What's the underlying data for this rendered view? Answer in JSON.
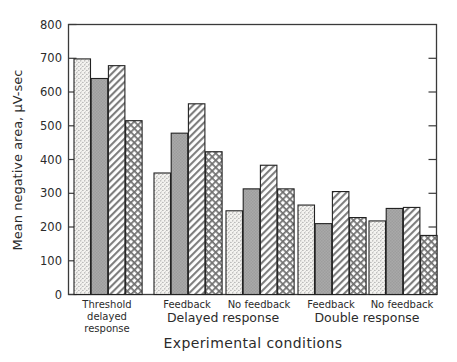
{
  "chart_data": {
    "type": "bar",
    "title": "",
    "subtitle": "",
    "xlabel": "Experimental conditions",
    "ylabel": "Mean negative area,  μV-sec",
    "ylim": [
      0,
      800
    ],
    "ytick_step": 100,
    "yticks": [
      "0",
      "100",
      "200",
      "300",
      "400",
      "500",
      "600",
      "700",
      "800"
    ],
    "grid": false,
    "legend": "none",
    "categories": [
      "Threshold delayed response",
      "Delayed response – Feedback",
      "Delayed response – No feedback",
      "Double response – Feedback",
      "Double response – No feedback"
    ],
    "series": [
      {
        "name": "Series 1",
        "pattern": "stipple",
        "values": [
          698,
          360,
          248,
          265,
          218
        ]
      },
      {
        "name": "Series 2",
        "pattern": "solid-gray",
        "values": [
          640,
          478,
          313,
          210,
          255
        ]
      },
      {
        "name": "Series 3",
        "pattern": "diagonal",
        "values": [
          678,
          565,
          383,
          305,
          258
        ]
      },
      {
        "name": "Series 4",
        "pattern": "crosshatch",
        "values": [
          515,
          423,
          313,
          228,
          175
        ]
      }
    ],
    "group_labels": [
      {
        "sub": "Threshold",
        "sub2": "delayed",
        "sub3": "response",
        "main": ""
      },
      {
        "sub": "Feedback",
        "sub2": "",
        "sub3": "",
        "main": "Delayed response"
      },
      {
        "sub": "No feedback",
        "sub2": "",
        "sub3": "",
        "main": ""
      },
      {
        "sub": "Feedback",
        "sub2": "",
        "sub3": "",
        "main": "Double response"
      },
      {
        "sub": "No feedback",
        "sub2": "",
        "sub3": "",
        "main": ""
      }
    ],
    "group_major_labels": [
      "Delayed response",
      "Double response"
    ],
    "colors": {
      "axis": "#3a3a3a",
      "text": "#2b2b2b",
      "bar_outline": "#222222",
      "stipple_fill": "#f2f1ee",
      "solid_gray_fill": "#a8a8a8",
      "hatch_fill": "#ffffff",
      "background": "#ffffff"
    }
  }
}
